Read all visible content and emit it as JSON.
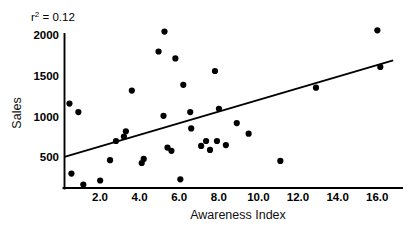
{
  "figure": {
    "annotation": {
      "prefix": "r",
      "superscript": "2",
      "suffix": "= 0.12"
    },
    "background": "#ffffff",
    "ink_color": "#000000"
  },
  "chart_data": {
    "type": "scatter",
    "title": "",
    "xlabel": "Awareness Index",
    "ylabel": "Sales",
    "xlim": [
      0,
      16.6
    ],
    "ylim": [
      0,
      2000
    ],
    "xticks": [
      2.0,
      4.0,
      6.0,
      8.0,
      10.0,
      12.0,
      14.0,
      16.0
    ],
    "xticklabels": [
      "2.0",
      "4.0",
      "6.0",
      "8.0",
      "10.0",
      "12.0",
      "14.0",
      "16.0"
    ],
    "yticks": [
      500,
      1000,
      1500,
      2000
    ],
    "yticklabels": [
      "500",
      "1000",
      "1500",
      "2000"
    ],
    "grid": false,
    "legend": null,
    "r_squared": 0.12,
    "annotations": [
      "r²= 0.12"
    ],
    "marker_color": "#000000",
    "marker_size": 3.1,
    "points": [
      {
        "x": 0.25,
        "y": 1160
      },
      {
        "x": 0.35,
        "y": 300
      },
      {
        "x": 0.7,
        "y": 1055
      },
      {
        "x": 0.95,
        "y": 165
      },
      {
        "x": 1.8,
        "y": 215
      },
      {
        "x": 2.3,
        "y": 465
      },
      {
        "x": 2.6,
        "y": 700
      },
      {
        "x": 3.0,
        "y": 755
      },
      {
        "x": 3.1,
        "y": 820
      },
      {
        "x": 3.4,
        "y": 1320
      },
      {
        "x": 3.9,
        "y": 430
      },
      {
        "x": 4.0,
        "y": 480
      },
      {
        "x": 4.75,
        "y": 1800
      },
      {
        "x": 5.0,
        "y": 1010
      },
      {
        "x": 5.05,
        "y": 2045
      },
      {
        "x": 5.2,
        "y": 620
      },
      {
        "x": 5.4,
        "y": 580
      },
      {
        "x": 5.6,
        "y": 1715
      },
      {
        "x": 5.85,
        "y": 230
      },
      {
        "x": 6.0,
        "y": 1390
      },
      {
        "x": 6.35,
        "y": 1055
      },
      {
        "x": 6.4,
        "y": 855
      },
      {
        "x": 6.9,
        "y": 640
      },
      {
        "x": 7.15,
        "y": 700
      },
      {
        "x": 7.35,
        "y": 590
      },
      {
        "x": 7.6,
        "y": 1560
      },
      {
        "x": 7.7,
        "y": 700
      },
      {
        "x": 7.8,
        "y": 1095
      },
      {
        "x": 8.15,
        "y": 650
      },
      {
        "x": 8.7,
        "y": 920
      },
      {
        "x": 9.3,
        "y": 790
      },
      {
        "x": 10.9,
        "y": 455
      },
      {
        "x": 12.7,
        "y": 1355
      },
      {
        "x": 15.8,
        "y": 2060
      },
      {
        "x": 15.95,
        "y": 1610
      }
    ],
    "trendline": {
      "x": [
        0,
        16.6
      ],
      "y": [
        505,
        1690
      ],
      "color": "#000000",
      "width": 1.9
    }
  }
}
